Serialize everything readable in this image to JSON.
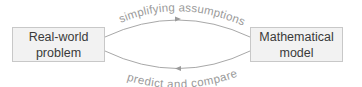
{
  "diagram": {
    "nodes": [
      {
        "id": "real-world",
        "lines": [
          "Real-world",
          "problem"
        ]
      },
      {
        "id": "mathematical",
        "lines": [
          "Mathematical",
          "model"
        ]
      }
    ],
    "edges": [
      {
        "from": "real-world",
        "to": "mathematical",
        "label": "simplifying assumptions"
      },
      {
        "from": "mathematical",
        "to": "real-world",
        "label": "predict and compare"
      }
    ],
    "colors": {
      "box_fill": "#f2f2f2",
      "box_border": "#c8c8c8",
      "text": "#3a3a3a",
      "arrow": "#9a9a9a",
      "label": "#9a9a9a"
    }
  }
}
